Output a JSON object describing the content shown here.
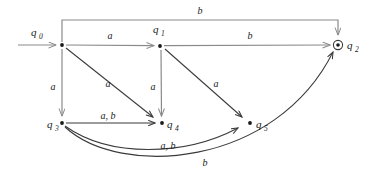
{
  "diagram": {
    "type": "finite-state-automaton",
    "colors": {
      "background": "#ffffff",
      "axis_line": "#8a8a8a",
      "curve_line": "#3a3a3a",
      "text": "#1a1a1a"
    },
    "start": {
      "label": "q",
      "sub": "0",
      "arrow_from_x": 18,
      "arrow_to_x": 58,
      "y": 45
    },
    "states": [
      {
        "id": "q0",
        "label": "q",
        "sub": "0",
        "x": 62,
        "y": 45,
        "accepting": false,
        "label_pos": "above-left"
      },
      {
        "id": "q1",
        "label": "q",
        "sub": "1",
        "x": 160,
        "y": 46,
        "accepting": false,
        "label_pos": "above"
      },
      {
        "id": "q2",
        "label": "q",
        "sub": "2",
        "x": 338,
        "y": 45,
        "accepting": true,
        "label_pos": "right"
      },
      {
        "id": "q3",
        "label": "q",
        "sub": "3",
        "x": 62,
        "y": 123,
        "accepting": false,
        "label_pos": "left"
      },
      {
        "id": "q4",
        "label": "q",
        "sub": "4",
        "x": 162,
        "y": 123,
        "accepting": false,
        "label_pos": "right"
      },
      {
        "id": "q5",
        "label": "q",
        "sub": "5",
        "x": 250,
        "y": 123,
        "accepting": false,
        "label_pos": "right"
      }
    ],
    "transitions": [
      {
        "id": "t-q0-q1",
        "from": "q0",
        "to": "q1",
        "symbol": "a",
        "shape": "straight",
        "label_x": 110,
        "label_y": 39
      },
      {
        "id": "t-q1-q2",
        "from": "q1",
        "to": "q2",
        "symbol": "b",
        "shape": "straight",
        "label_x": 250,
        "label_y": 39
      },
      {
        "id": "t-q0-q2",
        "from": "q0",
        "to": "q2",
        "symbol": "b",
        "shape": "orthogonal-top",
        "label_x": 200,
        "label_y": 13
      },
      {
        "id": "t-q0-q3",
        "from": "q0",
        "to": "q3",
        "symbol": "a",
        "shape": "straight-vertical",
        "label_x": 52,
        "label_y": 88
      },
      {
        "id": "t-q0-q4",
        "from": "q0",
        "to": "q4",
        "symbol": "a",
        "shape": "diagonal",
        "label_x": 108,
        "label_y": 86
      },
      {
        "id": "t-q1-q4",
        "from": "q1",
        "to": "q4",
        "symbol": "a",
        "shape": "straight-vertical",
        "label_x": 153,
        "label_y": 88
      },
      {
        "id": "t-q1-q5",
        "from": "q1",
        "to": "q5",
        "symbol": "a",
        "shape": "diagonal",
        "label_x": 217,
        "label_y": 86
      },
      {
        "id": "t-q3-q4",
        "from": "q3",
        "to": "q4",
        "symbol": "a, b",
        "shape": "straight",
        "label_x": 108,
        "label_y": 118
      },
      {
        "id": "t-q3-q5",
        "from": "q3",
        "to": "q5",
        "symbol": "a, b",
        "shape": "curve",
        "label_x": 168,
        "label_y": 148
      },
      {
        "id": "t-q3-q2",
        "from": "q3",
        "to": "q2",
        "symbol": "b",
        "shape": "curve-long",
        "label_x": 205,
        "label_y": 165
      }
    ]
  }
}
